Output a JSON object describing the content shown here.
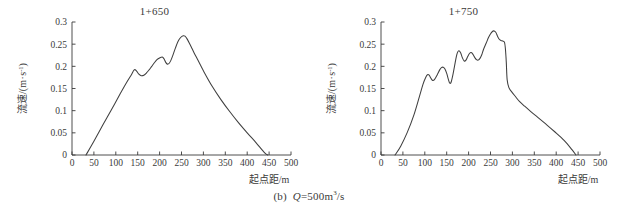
{
  "figure": {
    "caption_prefix": "(b)",
    "caption_symbol": "Q",
    "caption_value": "=500m",
    "caption_exponent": "3",
    "caption_suffix": "/s",
    "caption_full": "(b) Q=500m³/s"
  },
  "panels": [
    {
      "id": "panel-left",
      "title": "1+650"
    },
    {
      "id": "panel-right",
      "title": "1+750"
    }
  ],
  "axis": {
    "x_title": "起点距/m",
    "y_title": "流速/(m·s⁻¹)",
    "y_title_main": "流速/(m",
    "y_title_dot": "·",
    "y_title_unit": "s",
    "y_title_exp": "-1",
    "y_title_close": ")",
    "x_ticks": [
      "0",
      "50",
      "100",
      "150",
      "200",
      "250",
      "300",
      "350",
      "400",
      "450",
      "500"
    ],
    "y_ticks": [
      "0",
      "0.05",
      "0.1",
      "0.15",
      "0.2",
      "0.25",
      "0.3"
    ]
  },
  "chart_data": [
    {
      "type": "line",
      "title": "1+650",
      "xlabel": "起点距/m",
      "ylabel": "流速/(m·s⁻¹)",
      "xlim": [
        0,
        500
      ],
      "ylim": [
        0,
        0.3
      ],
      "xticks": [
        0,
        50,
        100,
        150,
        200,
        250,
        300,
        350,
        400,
        450,
        500
      ],
      "yticks": [
        0,
        0.05,
        0.1,
        0.15,
        0.2,
        0.25,
        0.3
      ],
      "grid": false,
      "legend": "none",
      "series": [
        {
          "name": "1+650",
          "x": [
            32,
            50,
            70,
            90,
            110,
            125,
            135,
            142,
            147,
            152,
            158,
            164,
            170,
            176,
            182,
            188,
            194,
            200,
            206,
            210,
            214,
            218,
            222,
            226,
            230,
            236,
            242,
            248,
            254,
            258,
            262,
            268,
            274,
            280,
            288,
            300,
            320,
            340,
            360,
            380,
            400,
            420,
            440,
            447
          ],
          "y": [
            0.0,
            0.031,
            0.067,
            0.102,
            0.138,
            0.164,
            0.18,
            0.192,
            0.19,
            0.183,
            0.179,
            0.18,
            0.185,
            0.192,
            0.2,
            0.208,
            0.215,
            0.219,
            0.221,
            0.217,
            0.209,
            0.205,
            0.207,
            0.214,
            0.224,
            0.241,
            0.256,
            0.265,
            0.269,
            0.268,
            0.263,
            0.252,
            0.24,
            0.228,
            0.213,
            0.19,
            0.155,
            0.125,
            0.098,
            0.073,
            0.05,
            0.028,
            0.005,
            0.0
          ]
        }
      ]
    },
    {
      "type": "line",
      "title": "1+750",
      "xlabel": "起点距/m",
      "ylabel": "流速/(m·s⁻¹)",
      "xlim": [
        0,
        500
      ],
      "ylim": [
        0,
        0.3
      ],
      "xticks": [
        0,
        50,
        100,
        150,
        200,
        250,
        300,
        350,
        400,
        450,
        500
      ],
      "yticks": [
        0,
        0.05,
        0.1,
        0.15,
        0.2,
        0.25,
        0.3
      ],
      "grid": false,
      "legend": "none",
      "series": [
        {
          "name": "1+750",
          "x": [
            32,
            45,
            60,
            75,
            88,
            96,
            102,
            106,
            110,
            114,
            118,
            122,
            128,
            134,
            138,
            142,
            146,
            150,
            154,
            157,
            160,
            164,
            168,
            172,
            175,
            178,
            182,
            186,
            190,
            194,
            198,
            202,
            206,
            210,
            214,
            218,
            222,
            226,
            230,
            234,
            240,
            246,
            252,
            257,
            262,
            266,
            270,
            274,
            278,
            282,
            284,
            286,
            288,
            292,
            298,
            306,
            316,
            328,
            342,
            358,
            376,
            396,
            418,
            436,
            445
          ],
          "y": [
            0.0,
            0.02,
            0.051,
            0.09,
            0.133,
            0.16,
            0.175,
            0.181,
            0.18,
            0.173,
            0.168,
            0.17,
            0.18,
            0.192,
            0.197,
            0.198,
            0.194,
            0.184,
            0.17,
            0.162,
            0.164,
            0.18,
            0.201,
            0.222,
            0.232,
            0.235,
            0.23,
            0.219,
            0.212,
            0.214,
            0.222,
            0.229,
            0.231,
            0.227,
            0.22,
            0.215,
            0.214,
            0.218,
            0.226,
            0.238,
            0.252,
            0.266,
            0.276,
            0.28,
            0.277,
            0.268,
            0.261,
            0.258,
            0.257,
            0.254,
            0.24,
            0.21,
            0.17,
            0.152,
            0.143,
            0.133,
            0.121,
            0.11,
            0.098,
            0.085,
            0.07,
            0.053,
            0.033,
            0.012,
            0.0
          ]
        }
      ]
    }
  ]
}
